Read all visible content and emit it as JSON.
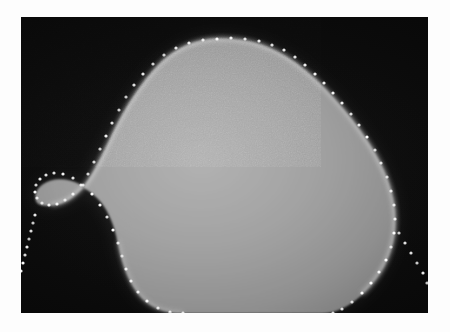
{
  "figure": {
    "kind": "grayscale-medical-image",
    "caption": "",
    "canvas": {
      "width": 450,
      "height": 332,
      "background": "#fdfdfd"
    },
    "frame": {
      "name": "image-frame",
      "x": 21,
      "y": 17,
      "width": 407,
      "height": 296,
      "background_color": "#080808",
      "border_color": "#000000"
    },
    "specimen": {
      "label": "bright rounded specimen",
      "fill_color": "#9c9c9c",
      "core_color": "#a8a8a8",
      "rim_color": "#e8e8e8",
      "shadow_color": "#6e6e6e",
      "description": "Large bright convex mass occupying the centre-right of the dark field, apex near top-centre, a rounded lobe bulging to the left with a concave notch below it, and a broad rounded right flank that meets the bottom of the frame."
    },
    "contour_overlay": {
      "label": "dotted boundary trace",
      "dot_color": "#ffffff",
      "dot_radius": 1.6,
      "style": "dotted",
      "note": "White dot markers follow the specimen outline and continue as two straight diagonal tails into the dark field at lower-left and lower-right."
    },
    "colors": {
      "background": "#fdfdfd",
      "dark_field": "#0a0a0a",
      "specimen_mid_gray": "#9c9c9c",
      "specimen_highlight": "#ededed",
      "contour_dot": "#ffffff"
    }
  },
  "chart_data": {
    "type": "scatter",
    "title": "",
    "xlabel": "",
    "ylabel": "",
    "xlim": [
      0,
      407
    ],
    "ylim": [
      0,
      296
    ],
    "grid": false,
    "legend": "none",
    "series": [
      {
        "name": "specimen-boundary-contour",
        "marker": "dot",
        "color": "#ffffff",
        "points": [
          [
            196,
            22
          ],
          [
            210,
            21
          ],
          [
            224,
            22
          ],
          [
            238,
            24
          ],
          [
            251,
            28
          ],
          [
            263,
            33
          ],
          [
            274,
            40
          ],
          [
            284,
            48
          ],
          [
            294,
            57
          ],
          [
            303,
            66
          ],
          [
            312,
            76
          ],
          [
            321,
            86
          ],
          [
            330,
            97
          ],
          [
            338,
            108
          ],
          [
            346,
            120
          ],
          [
            354,
            133
          ],
          [
            360,
            146
          ],
          [
            366,
            160
          ],
          [
            370,
            174
          ],
          [
            373,
            188
          ],
          [
            374,
            202
          ],
          [
            373,
            216
          ],
          [
            370,
            230
          ],
          [
            365,
            243
          ],
          [
            358,
            255
          ],
          [
            350,
            266
          ],
          [
            341,
            276
          ],
          [
            331,
            285
          ],
          [
            321,
            292
          ],
          [
            312,
            296
          ],
          [
            182,
            23
          ],
          [
            168,
            26
          ],
          [
            155,
            31
          ],
          [
            143,
            38
          ],
          [
            132,
            47
          ],
          [
            122,
            57
          ],
          [
            113,
            68
          ],
          [
            105,
            80
          ],
          [
            98,
            93
          ],
          [
            91,
            106
          ],
          [
            85,
            119
          ],
          [
            79,
            132
          ],
          [
            73,
            145
          ],
          [
            67,
            157
          ],
          [
            60,
            168
          ],
          [
            52,
            177
          ],
          [
            44,
            183
          ],
          [
            36,
            187
          ],
          [
            28,
            188
          ],
          [
            21,
            186
          ],
          [
            16,
            181
          ],
          [
            14,
            175
          ],
          [
            15,
            168
          ],
          [
            19,
            162
          ],
          [
            25,
            158
          ],
          [
            33,
            156
          ],
          [
            42,
            157
          ],
          [
            52,
            161
          ],
          [
            62,
            168
          ],
          [
            71,
            177
          ],
          [
            79,
            188
          ],
          [
            86,
            200
          ],
          [
            92,
            213
          ],
          [
            97,
            226
          ],
          [
            101,
            239
          ],
          [
            105,
            252
          ],
          [
            110,
            264
          ],
          [
            117,
            275
          ],
          [
            126,
            284
          ],
          [
            137,
            291
          ],
          [
            149,
            295
          ],
          [
            162,
            296
          ]
        ]
      },
      {
        "name": "lower-left-dotted-tail",
        "marker": "dot",
        "color": "#ffffff",
        "points": [
          [
            14,
            198
          ],
          [
            12,
            206
          ],
          [
            10,
            214
          ],
          [
            8,
            222
          ],
          [
            6,
            230
          ],
          [
            4,
            238
          ],
          [
            2,
            246
          ],
          [
            0,
            254
          ]
        ]
      },
      {
        "name": "lower-right-dotted-tail",
        "marker": "dot",
        "color": "#ffffff",
        "points": [
          [
            378,
            216
          ],
          [
            384,
            226
          ],
          [
            390,
            236
          ],
          [
            396,
            246
          ],
          [
            402,
            256
          ],
          [
            406,
            266
          ]
        ]
      }
    ]
  }
}
